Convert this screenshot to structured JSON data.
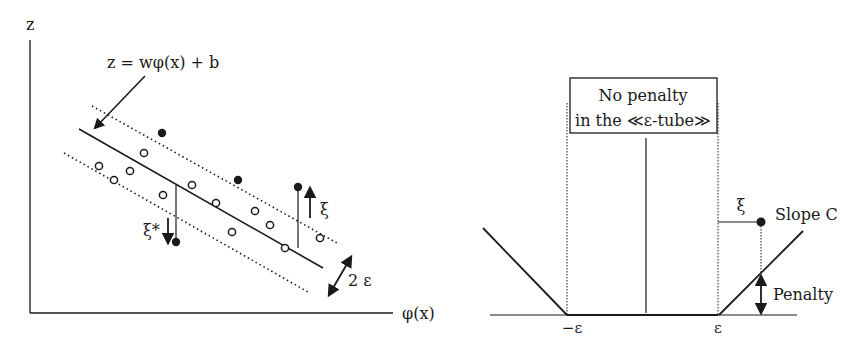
{
  "left_panel": {
    "y_axis_label": "z",
    "x_axis_label": "φ(x)",
    "regression_equation": "z = wφ(x) + b",
    "tube_width_label": "2 ε",
    "slack_above_label": "ξ",
    "slack_below_label": "ξ*",
    "points": {
      "filled": [
        [
          162,
          133
        ],
        [
          238,
          180
        ],
        [
          298,
          187
        ],
        [
          176,
          242
        ]
      ],
      "open": [
        [
          99,
          166
        ],
        [
          114,
          180
        ],
        [
          130,
          171
        ],
        [
          144,
          153
        ],
        [
          163,
          195
        ],
        [
          192,
          185
        ],
        [
          216,
          203
        ],
        [
          232,
          232
        ],
        [
          255,
          211
        ],
        [
          270,
          225
        ],
        [
          285,
          248
        ],
        [
          320,
          238
        ]
      ]
    }
  },
  "right_panel": {
    "box_line1": "No penalty",
    "box_line2": "in the ≪ε-tube≫",
    "neg_epsilon_label": "−ε",
    "pos_epsilon_label": "ε",
    "slack_label": "ξ",
    "slope_label": "Slope C",
    "penalty_label": "Penalty"
  },
  "colors": {
    "ink": "#1a1a1a",
    "background": "#ffffff"
  }
}
